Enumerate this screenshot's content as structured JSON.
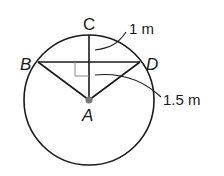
{
  "diagram": {
    "type": "circle-geometry",
    "points": {
      "A": {
        "label": "A",
        "role": "center"
      },
      "B": {
        "label": "B",
        "role": "chord-endpoint"
      },
      "C": {
        "label": "C",
        "role": "point-on-circle"
      },
      "D": {
        "label": "D",
        "role": "chord-endpoint"
      }
    },
    "measurements": {
      "segment_upper": "1 m",
      "segment_lower": "1.5 m"
    },
    "colors": {
      "stroke": "#1a1a1a",
      "right_angle_marker": "#888888",
      "center_dot": "#777777"
    }
  }
}
